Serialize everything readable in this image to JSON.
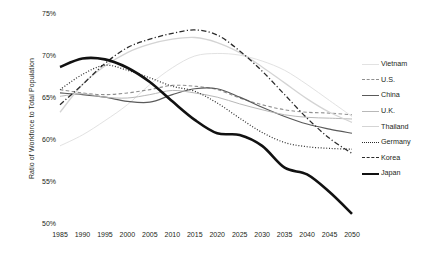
{
  "chart_data": {
    "type": "line",
    "title": "",
    "xlabel": "",
    "ylabel": "Ratio of Workforce to Total Population",
    "x": [
      1985,
      1990,
      1995,
      2000,
      2005,
      2010,
      2015,
      2020,
      2025,
      2030,
      2035,
      2040,
      2045,
      2050
    ],
    "xlim": [
      1985,
      2050
    ],
    "ylim": [
      50,
      75
    ],
    "yticks": [
      50,
      55,
      60,
      65,
      70,
      75
    ],
    "ytick_labels": [
      "50%",
      "55%",
      "60%",
      "65%",
      "70%",
      "75%"
    ],
    "xtick_labels": [
      "1985",
      "1990",
      "1995",
      "2000",
      "2005",
      "2010",
      "2015",
      "2020",
      "2025",
      "2030",
      "2035",
      "2040",
      "2045",
      "2050"
    ],
    "grid": false,
    "legend_position": "right",
    "series": [
      {
        "name": "Vietnam",
        "style": "solid",
        "color": "#e2e2e2",
        "width": 1.0,
        "values": [
          59.3,
          60.6,
          62.3,
          64.2,
          66.6,
          68.6,
          70.0,
          70.3,
          70.1,
          69.4,
          68.3,
          66.6,
          64.7,
          62.8
        ]
      },
      {
        "name": "U.S.",
        "style": "dashed",
        "color": "#8f8f8f",
        "width": 1.1,
        "values": [
          66.0,
          65.6,
          65.4,
          65.6,
          66.0,
          66.5,
          66.4,
          66.0,
          65.0,
          64.2,
          63.6,
          63.3,
          63.2,
          63.0
        ]
      },
      {
        "name": "China",
        "style": "solid",
        "color": "#5a5a5a",
        "width": 1.2,
        "values": [
          65.6,
          65.4,
          65.1,
          64.6,
          64.5,
          65.4,
          66.1,
          66.1,
          65.1,
          63.9,
          62.8,
          61.9,
          61.3,
          60.8
        ]
      },
      {
        "name": "U.K.",
        "style": "solid",
        "color": "#b8b8b8",
        "width": 1.0,
        "values": [
          65.2,
          65.5,
          65.1,
          65.0,
          65.4,
          65.9,
          65.6,
          65.1,
          64.3,
          63.6,
          63.0,
          62.7,
          62.6,
          62.5
        ]
      },
      {
        "name": "Thailand",
        "style": "solid",
        "color": "#d4d4d4",
        "width": 1.3,
        "values": [
          63.3,
          66.6,
          68.8,
          70.4,
          71.4,
          72.0,
          72.2,
          71.6,
          70.4,
          68.7,
          66.8,
          64.9,
          63.3,
          62.1
        ]
      },
      {
        "name": "Germany",
        "style": "dotted",
        "color": "#2b2b2b",
        "width": 1.2,
        "values": [
          66.0,
          67.8,
          68.9,
          68.3,
          67.4,
          66.4,
          65.8,
          64.4,
          62.6,
          60.9,
          59.7,
          59.2,
          59.0,
          58.9
        ]
      },
      {
        "name": "Korea",
        "style": "dash-dot",
        "color": "#2b2b2b",
        "width": 1.3,
        "values": [
          64.2,
          66.6,
          69.1,
          71.0,
          72.0,
          72.7,
          73.1,
          72.5,
          70.6,
          68.2,
          65.4,
          62.6,
          60.2,
          58.4
        ]
      },
      {
        "name": "Japan",
        "style": "solid",
        "color": "#111111",
        "width": 2.6,
        "values": [
          68.7,
          69.7,
          69.6,
          68.6,
          66.9,
          64.6,
          62.4,
          60.8,
          60.6,
          59.3,
          56.7,
          55.9,
          53.8,
          51.2
        ]
      }
    ]
  },
  "legend": {
    "items": [
      {
        "label": "Vietnam"
      },
      {
        "label": "U.S."
      },
      {
        "label": "China"
      },
      {
        "label": "U.K."
      },
      {
        "label": "Thailand"
      },
      {
        "label": "Germany"
      },
      {
        "label": "Korea"
      },
      {
        "label": "Japan"
      }
    ]
  }
}
